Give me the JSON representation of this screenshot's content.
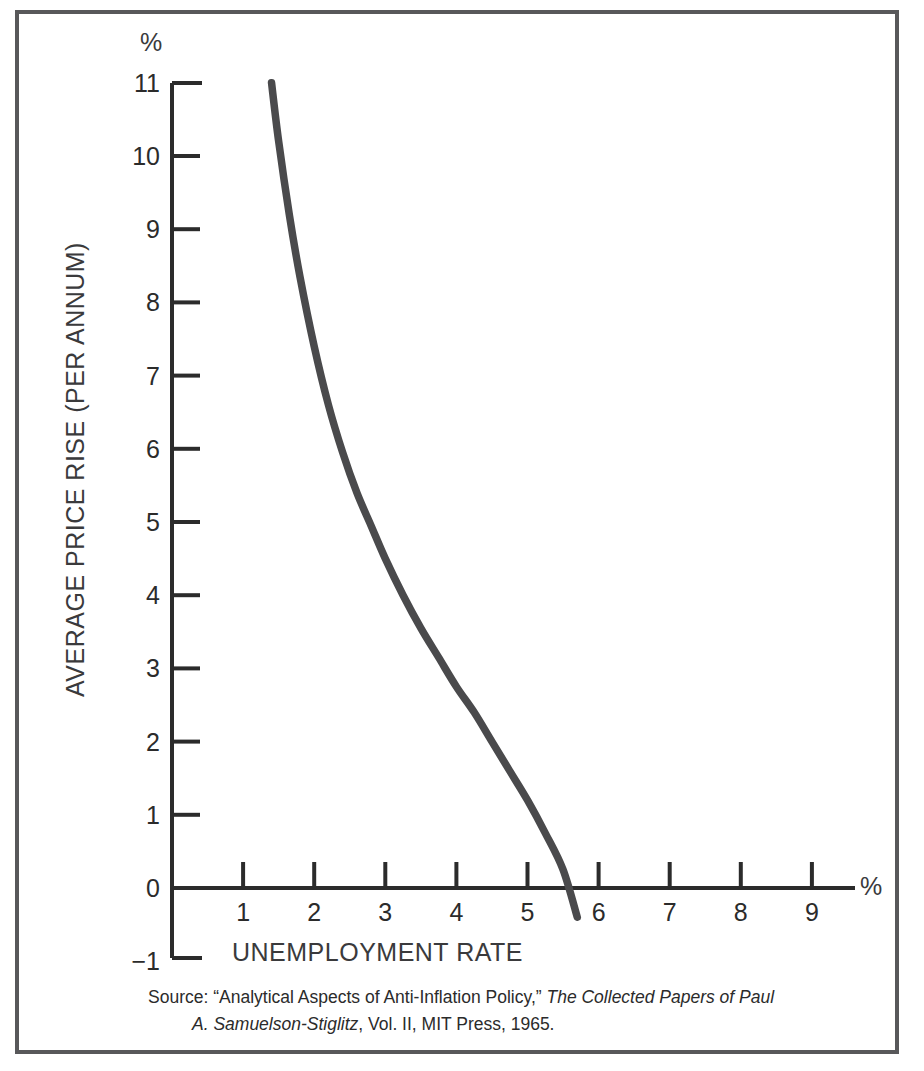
{
  "figure": {
    "y_unit_label": "%",
    "x_unit_label": "%",
    "y_axis_title": "AVERAGE PRICE RISE (PER ANNUM)",
    "x_axis_title": "UNEMPLOYMENT RATE",
    "border_color": "#58585a",
    "curve_color": "#4a4a4c"
  },
  "source": {
    "prefix": "Source:  “Analytical Aspects of Anti-Inflation Policy,” ",
    "title_line1": "The Collected Papers of Paul",
    "title_line2": "A. Samuelson-Stiglitz",
    "suffix": ", Vol. II, MIT Press, 1965."
  },
  "chart_data": {
    "type": "line",
    "title": "",
    "subtitle": "",
    "xlabel": "UNEMPLOYMENT RATE",
    "ylabel": "AVERAGE PRICE RISE (PER ANNUM)",
    "x_unit": "%",
    "y_unit": "%",
    "xlim": [
      0,
      9.6
    ],
    "ylim": [
      -1,
      11
    ],
    "grid": false,
    "legend": "none",
    "xticks": [
      1,
      2,
      3,
      4,
      5,
      6,
      7,
      8,
      9
    ],
    "xtick_labels": [
      "1",
      "2",
      "3",
      "4",
      "5",
      "6",
      "7",
      "8",
      "9"
    ],
    "yticks": [
      -1,
      0,
      1,
      2,
      3,
      4,
      5,
      6,
      7,
      8,
      9,
      10,
      11
    ],
    "ytick_labels": [
      "-1",
      "0",
      "1",
      "2",
      "3",
      "4",
      "5",
      "6",
      "7",
      "8",
      "9",
      "10",
      "11"
    ],
    "series": [
      {
        "name": "Phillips curve",
        "x": [
          1.4,
          1.5,
          1.65,
          1.8,
          2.0,
          2.2,
          2.4,
          2.6,
          2.8,
          3.0,
          3.25,
          3.5,
          3.75,
          4.0,
          4.25,
          4.5,
          4.75,
          5.0,
          5.25,
          5.5,
          5.7
        ],
        "y": [
          11.0,
          10.2,
          9.2,
          8.35,
          7.4,
          6.6,
          5.95,
          5.4,
          4.95,
          4.5,
          4.0,
          3.55,
          3.15,
          2.75,
          2.4,
          2.0,
          1.6,
          1.2,
          0.75,
          0.25,
          -0.4
        ]
      }
    ]
  }
}
